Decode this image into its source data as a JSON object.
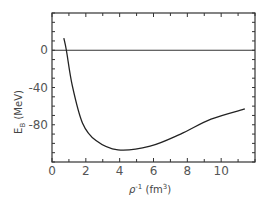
{
  "chart_data": {
    "type": "line",
    "title": "",
    "xlabel": "ρ⁻¹ (fm³)",
    "ylabel": "E_B (MeV)",
    "xlim": [
      0,
      12
    ],
    "ylim": [
      -120,
      40
    ],
    "x_ticks": [
      0,
      2,
      4,
      6,
      8,
      10
    ],
    "x_tick_labels": [
      "0",
      "2",
      "4",
      "6",
      "8",
      "10"
    ],
    "x_minor_step": 1,
    "y_ticks": [
      0,
      -40,
      -80
    ],
    "y_tick_labels": [
      "0",
      "-40",
      "-80"
    ],
    "y_minor_step": 10,
    "grid": false,
    "legend": null,
    "reference_line": {
      "y": 0
    },
    "series": [
      {
        "name": "E_B",
        "x": [
          0.7,
          0.85,
          1.2,
          1.8,
          2.6,
          3.9,
          5.8,
          7.6,
          9.4,
          11.4
        ],
        "y": [
          13,
          0,
          -38,
          -78,
          -97,
          -107,
          -103,
          -90,
          -74,
          -63
        ]
      }
    ]
  },
  "labels": {
    "ylabel_main": "E",
    "ylabel_sub": "B",
    "ylabel_unit": " (MeV)",
    "xlabel_rho": "ρ",
    "xlabel_exp": "-1",
    "xlabel_unit": " (fm",
    "xlabel_unit_exp": "3",
    "xlabel_close": ")"
  }
}
